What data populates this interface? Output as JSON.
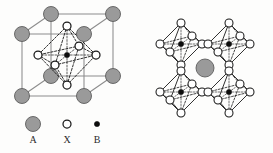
{
  "figure": {
    "background_color": "#fdfdfc",
    "width": 273,
    "height": 153
  },
  "colors": {
    "atom_a_fill": "#9a9a9a",
    "atom_a_stroke": "#5e5e5e",
    "atom_x_fill": "#ffffff",
    "atom_x_stroke": "#1a1a1a",
    "atom_b_fill": "#0d0d0d",
    "atom_b_stroke": "#0d0d0d",
    "cell_edge": "#8c8c8c",
    "bond_solid": "#1a1a1a",
    "bond_dashed": "#1a1a1a",
    "label_text": "#2b2b2b"
  },
  "legend": {
    "items": [
      {
        "key": "A",
        "label": "A",
        "symbol": "large-gray-filled-circle",
        "radius": 7.5
      },
      {
        "key": "X",
        "label": "X",
        "symbol": "small-open-circle",
        "radius": 4.0
      },
      {
        "key": "B",
        "label": "B",
        "symbol": "small-black-filled-circle",
        "radius": 2.6
      }
    ]
  },
  "panels": [
    {
      "id": "unit-cell",
      "name": "left-unit-cell-panel",
      "description": "Single ABX3 unit cell: A cations at the eight cube corners, B cation at the body centre, X anions forming a BX6 octahedron drawn with dashed edges.",
      "cube": {
        "edge_style": "solid",
        "front_face_corners": [
          [
            22,
            96
          ],
          [
            22,
            34
          ],
          [
            84,
            34
          ],
          [
            84,
            96
          ]
        ],
        "depth_offset": [
          29,
          -20
        ]
      },
      "atoms_a": [
        {
          "x": 22,
          "y": 34,
          "r": 7.5,
          "site": "front-top-left"
        },
        {
          "x": 84,
          "y": 34,
          "r": 7.5,
          "site": "front-top-right"
        },
        {
          "x": 22,
          "y": 96,
          "r": 7.5,
          "site": "front-bottom-left"
        },
        {
          "x": 84,
          "y": 96,
          "r": 7.5,
          "site": "front-bottom-right"
        },
        {
          "x": 51,
          "y": 14,
          "r": 7.5,
          "site": "back-top-left"
        },
        {
          "x": 113,
          "y": 14,
          "r": 7.5,
          "site": "back-top-right"
        },
        {
          "x": 51,
          "y": 76,
          "r": 7.5,
          "site": "back-bottom-left"
        },
        {
          "x": 113,
          "y": 76,
          "r": 7.5,
          "site": "back-bottom-right"
        }
      ],
      "atoms_b": [
        {
          "x": 67,
          "y": 55,
          "r": 2.6,
          "site": "body-centre"
        }
      ],
      "atoms_x": [
        {
          "x": 67,
          "y": 26,
          "r": 4.0,
          "site": "face-centre-top"
        },
        {
          "x": 67,
          "y": 85,
          "r": 4.0,
          "site": "face-centre-bottom"
        },
        {
          "x": 38,
          "y": 55,
          "r": 4.0,
          "site": "face-centre-left"
        },
        {
          "x": 96,
          "y": 55,
          "r": 4.0,
          "site": "face-centre-right"
        },
        {
          "x": 55,
          "y": 65,
          "r": 4.0,
          "site": "face-centre-front"
        },
        {
          "x": 79,
          "y": 46,
          "r": 4.0,
          "site": "face-centre-back"
        }
      ]
    },
    {
      "id": "octahedra-network",
      "name": "right-octahedra-network-panel",
      "description": "Corner-sharing BX6 octahedra network (2 x 2 array) with one A cation occupying the central twelve-coordinate cavity.",
      "octahedra": [
        {
          "cx": 181,
          "cy": 44,
          "site": "upper-left"
        },
        {
          "cx": 229,
          "cy": 44,
          "site": "upper-right"
        },
        {
          "cx": 181,
          "cy": 92,
          "site": "lower-left"
        },
        {
          "cx": 229,
          "cy": 92,
          "site": "lower-right"
        }
      ],
      "atoms_a": [
        {
          "x": 205,
          "y": 68,
          "r": 9.0,
          "site": "cavity-centre"
        }
      ]
    }
  ]
}
